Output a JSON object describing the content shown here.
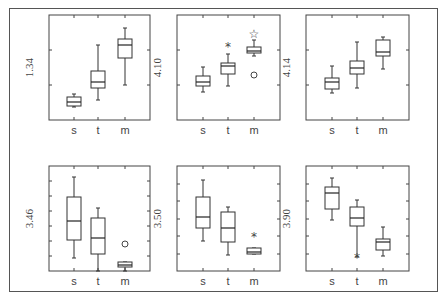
{
  "chart_data": {
    "type": "boxplot",
    "layout": {
      "rows": 2,
      "cols": 3
    },
    "categories": [
      "s",
      "t",
      "m"
    ],
    "panels": [
      {
        "ylabel": "1.34",
        "px": {
          "left": 49,
          "right": 150,
          "top": 15,
          "bottom": 120
        },
        "cx": [
          74,
          98,
          125
        ],
        "yticks": [
          50,
          85
        ],
        "boxes": [
          {
            "cat": "s",
            "wlo": 107,
            "q1": 106,
            "med": 102,
            "q3": 97,
            "whi": 94
          },
          {
            "cat": "t",
            "wlo": 100,
            "q1": 88,
            "med": 82,
            "q3": 71,
            "whi": 45
          },
          {
            "cat": "m",
            "wlo": 85,
            "q1": 58,
            "med": 45,
            "q3": 39,
            "whi": 28
          }
        ],
        "outliers": []
      },
      {
        "ylabel": "4.10",
        "px": {
          "left": 177,
          "right": 280,
          "top": 15,
          "bottom": 120
        },
        "cx": [
          203,
          228,
          254
        ],
        "yticks": [
          50,
          85
        ],
        "boxes": [
          {
            "cat": "s",
            "wlo": 92,
            "q1": 86,
            "med": 82,
            "q3": 76,
            "whi": 67
          },
          {
            "cat": "t",
            "wlo": 86,
            "q1": 74,
            "med": 66,
            "q3": 63,
            "whi": 54
          },
          {
            "cat": "m",
            "wlo": 56,
            "q1": 53,
            "med": 51,
            "q3": 47,
            "whi": 40
          }
        ],
        "outliers": [
          {
            "cat": "t",
            "y": 46,
            "glyph": "*"
          },
          {
            "cat": "m",
            "y": 33,
            "glyph": "☆"
          },
          {
            "cat": "m",
            "y": 75,
            "glyph": "○"
          }
        ]
      },
      {
        "ylabel": "4.14",
        "px": {
          "left": 306,
          "right": 409,
          "top": 15,
          "bottom": 120
        },
        "cx": [
          332,
          357,
          383
        ],
        "yticks": [
          50,
          85
        ],
        "boxes": [
          {
            "cat": "s",
            "wlo": 93,
            "q1": 89,
            "med": 82,
            "q3": 78,
            "whi": 66
          },
          {
            "cat": "t",
            "wlo": 88,
            "q1": 74,
            "med": 68,
            "q3": 61,
            "whi": 42
          },
          {
            "cat": "m",
            "wlo": 69,
            "q1": 56,
            "med": 52,
            "q3": 40,
            "whi": 37
          }
        ],
        "outliers": []
      },
      {
        "ylabel": "3.46",
        "px": {
          "left": 49,
          "right": 150,
          "top": 166,
          "bottom": 271
        },
        "cx": [
          74,
          98,
          125
        ],
        "yticks": [
          181,
          196,
          211,
          226,
          241,
          256
        ],
        "boxes": [
          {
            "cat": "s",
            "wlo": 258,
            "q1": 240,
            "med": 221,
            "q3": 197,
            "whi": 177
          },
          {
            "cat": "t",
            "wlo": 271,
            "q1": 254,
            "med": 238,
            "q3": 218,
            "whi": 208
          },
          {
            "cat": "m",
            "wlo": 271,
            "q1": 267,
            "med": 265,
            "q3": 262,
            "whi": 262
          }
        ],
        "outliers": [
          {
            "cat": "m",
            "y": 244,
            "glyph": "○"
          }
        ]
      },
      {
        "ylabel": "3.50",
        "px": {
          "left": 177,
          "right": 280,
          "top": 166,
          "bottom": 271
        },
        "cx": [
          203,
          228,
          254
        ],
        "yticks": [
          184,
          201,
          219,
          236,
          254
        ],
        "boxes": [
          {
            "cat": "s",
            "wlo": 241,
            "q1": 228,
            "med": 217,
            "q3": 197,
            "whi": 180
          },
          {
            "cat": "t",
            "wlo": 255,
            "q1": 242,
            "med": 228,
            "q3": 212,
            "whi": 207
          },
          {
            "cat": "m",
            "wlo": 254,
            "q1": 254,
            "med": 252,
            "q3": 248,
            "whi": 248
          }
        ],
        "outliers": [
          {
            "cat": "m",
            "y": 236,
            "glyph": "*"
          }
        ]
      },
      {
        "ylabel": "3.90",
        "px": {
          "left": 306,
          "right": 409,
          "top": 166,
          "bottom": 271
        },
        "cx": [
          332,
          357,
          383
        ],
        "yticks": [
          184,
          201,
          219,
          236,
          254
        ],
        "boxes": [
          {
            "cat": "s",
            "wlo": 220,
            "q1": 209,
            "med": 193,
            "q3": 187,
            "whi": 178
          },
          {
            "cat": "t",
            "wlo": 257,
            "q1": 226,
            "med": 218,
            "q3": 207,
            "whi": 200
          },
          {
            "cat": "m",
            "wlo": 256,
            "q1": 250,
            "med": 242,
            "q3": 239,
            "whi": 227
          }
        ],
        "outliers": [
          {
            "cat": "t",
            "y": 257,
            "glyph": "*"
          }
        ]
      }
    ],
    "title": "",
    "xlabel": "",
    "legend": null,
    "grid": false
  }
}
